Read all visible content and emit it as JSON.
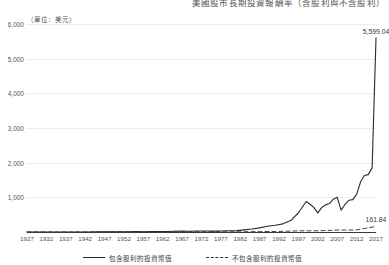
{
  "chart_data": {
    "type": "line",
    "title": "美國股市長期投資報酬率（含股利與不含股利）",
    "unit_label": "（單位：美元）",
    "xlabel": "",
    "ylabel": "",
    "ylim": [
      0,
      6000
    ],
    "xlim": [
      1927,
      2017
    ],
    "grid": true,
    "legend_position": "bottom-center",
    "yticks": [
      "1,000",
      "2,000",
      "3,000",
      "4,000",
      "5,000",
      "6,000"
    ],
    "ytick_values": [
      1000,
      2000,
      3000,
      4000,
      5000,
      6000
    ],
    "categories": [
      1927,
      1932,
      1937,
      1942,
      1947,
      1952,
      1957,
      1962,
      1967,
      1972,
      1977,
      1982,
      1987,
      1992,
      1997,
      2002,
      2007,
      2012,
      2017
    ],
    "xtick_labels": [
      "1927",
      "1932",
      "1937",
      "1942",
      "1947",
      "1952",
      "1957",
      "1962",
      "1967",
      "1972",
      "1977",
      "1982",
      "1987",
      "1992",
      "1997",
      "2002",
      "2007",
      "2012",
      "2017"
    ],
    "series": [
      {
        "name": "包含股利的投資幣值",
        "style": "solid",
        "color": "#2b2b2b",
        "end_label": "5,599.04",
        "end_value": 5599.04,
        "x": [
          1927,
          1929,
          1931,
          1933,
          1935,
          1937,
          1939,
          1941,
          1943,
          1945,
          1947,
          1949,
          1951,
          1953,
          1955,
          1957,
          1959,
          1961,
          1963,
          1965,
          1967,
          1969,
          1971,
          1973,
          1975,
          1977,
          1979,
          1981,
          1983,
          1985,
          1987,
          1989,
          1991,
          1993,
          1995,
          1997,
          1999,
          2000,
          2001,
          2002,
          2003,
          2004,
          2005,
          2006,
          2007,
          2008,
          2009,
          2010,
          2011,
          2012,
          2013,
          2014,
          2015,
          2016,
          2017
        ],
        "values": [
          1,
          1.3,
          0.7,
          0.9,
          1.5,
          1.4,
          1.3,
          1.2,
          1.9,
          3.0,
          3.2,
          3.6,
          5.2,
          5.6,
          9.5,
          8.8,
          12.0,
          14.5,
          16.5,
          21.0,
          24.0,
          23.0,
          27.0,
          29.0,
          24.0,
          29.0,
          36.0,
          40.0,
          62.0,
          86.0,
          118.0,
          168.0,
          196.0,
          235.0,
          330.0,
          555.0,
          880.0,
          800.0,
          705.0,
          550.0,
          705.0,
          782.0,
          820.0,
          948.0,
          1000.0,
          630.0,
          795.0,
          915.0,
          935.0,
          1085.0,
          1435.0,
          1630.0,
          1655.0,
          1850.0,
          5599.04
        ]
      },
      {
        "name": "不包含股利的投資幣值",
        "style": "dashed",
        "color": "#2b2b2b",
        "end_label": "161.84",
        "end_value": 161.84,
        "x": [
          1927,
          1932,
          1937,
          1942,
          1947,
          1952,
          1957,
          1962,
          1967,
          1972,
          1977,
          1982,
          1987,
          1992,
          1997,
          2002,
          2007,
          2012,
          2017
        ],
        "values": [
          1,
          0.5,
          0.9,
          0.8,
          1.2,
          2.0,
          2.8,
          3.3,
          5.0,
          6.5,
          5.2,
          6.0,
          12.5,
          16.0,
          33.0,
          34.0,
          56.0,
          58.0,
          161.84
        ]
      }
    ],
    "annotations": [
      {
        "text": "5,599.04",
        "x": 2017,
        "y": 5599.04
      },
      {
        "text": "161.84",
        "x": 2017,
        "y": 161.84
      }
    ]
  }
}
